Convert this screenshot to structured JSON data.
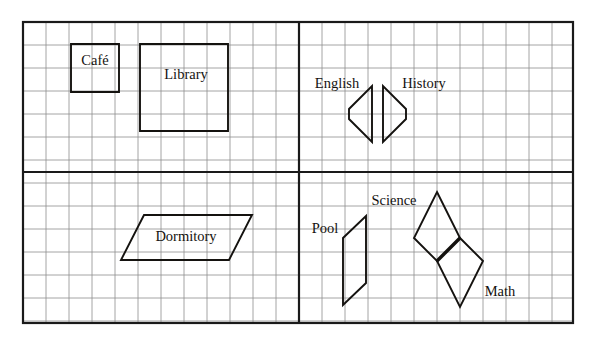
{
  "canvas": {
    "width": 596,
    "height": 342,
    "background_color": "#ffffff"
  },
  "grid": {
    "origin_x": 23,
    "origin_y": 22,
    "right": 573,
    "bottom": 323,
    "cell_size": 23,
    "minor_line_color": "#8d8d8d",
    "major_line_color": "#1a1a1a",
    "border_color": "#1a1a1a",
    "border_width": 2.2,
    "minor_line_width": 0.8,
    "divider_width": 2.2,
    "divider_x": 299,
    "divider_y": 172
  },
  "shape_style": {
    "stroke_color": "#14120f",
    "stroke_width": 1.9,
    "fill": "none",
    "emphasis_stroke_width": 3.4
  },
  "quadrants": [
    {
      "name": "top-left",
      "label": "campus-quadrant-top-left"
    },
    {
      "name": "top-right",
      "label": "campus-quadrant-top-right"
    },
    {
      "name": "bottom-left",
      "label": "campus-quadrant-bottom-left"
    },
    {
      "name": "bottom-right",
      "label": "campus-quadrant-bottom-right"
    }
  ],
  "shapes": [
    {
      "id": "cafe",
      "label": "Café",
      "kind": "square",
      "quadrant": "top-left",
      "points": "71,44 119,44 119,92 71,92",
      "label_x": 95,
      "label_y": 62,
      "label_anchor": "middle"
    },
    {
      "id": "library",
      "label": "Library",
      "kind": "square",
      "quadrant": "top-left",
      "points": "140,44 228,44 228,131 140,131",
      "label_x": 186,
      "label_y": 76,
      "label_anchor": "middle"
    },
    {
      "id": "english",
      "label": "English",
      "kind": "trapezoid",
      "quadrant": "top-right",
      "points": "372,86 372,142 349,119 349,109",
      "label_x": 337,
      "label_y": 85,
      "label_anchor": "middle"
    },
    {
      "id": "history",
      "label": "History",
      "kind": "trapezoid",
      "quadrant": "top-right",
      "points": "383,86 383,142 406,119 406,109",
      "label_x": 424,
      "label_y": 85,
      "label_anchor": "middle"
    },
    {
      "id": "dormitory",
      "label": "Dormitory",
      "kind": "parallelogram",
      "quadrant": "bottom-left",
      "points": "144,215 252,215 229,260 121,260",
      "label_x": 186,
      "label_y": 238,
      "label_anchor": "middle"
    },
    {
      "id": "pool",
      "label": "Pool",
      "kind": "parallelogram",
      "quadrant": "bottom-right",
      "points": "366,216 366,283 343,305 343,238",
      "label_x": 325,
      "label_y": 230,
      "label_anchor": "middle"
    },
    {
      "id": "science",
      "label": "Science",
      "kind": "rhombus",
      "quadrant": "bottom-right",
      "points": "437,192 460,238 437,261 414,238",
      "label_x": 394,
      "label_y": 202,
      "label_anchor": "middle"
    },
    {
      "id": "math",
      "label": "Math",
      "kind": "rhombus",
      "quadrant": "bottom-right",
      "points": "460,238 483,261 460,307 437,261",
      "label_x": 500,
      "label_y": 293,
      "label_anchor": "middle"
    }
  ],
  "shared_edges": [
    {
      "id": "science-math-shared-edge",
      "from_shape": "science",
      "to_shape": "math",
      "points": "460,238 437,261"
    }
  ]
}
